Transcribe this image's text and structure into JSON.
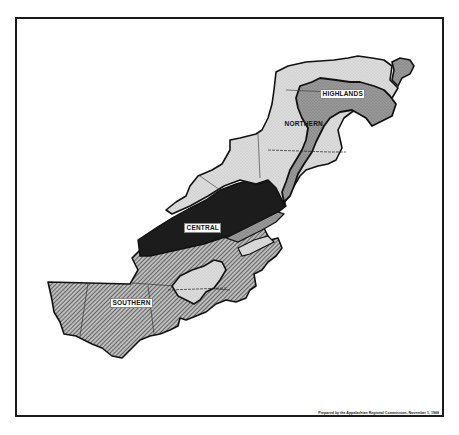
{
  "map": {
    "title": "",
    "regions": [
      {
        "id": "highlands",
        "label": "HIGHLANDS",
        "fill": "#8c8c8c",
        "pattern": "stipple-dark"
      },
      {
        "id": "northern",
        "label": "NORTHERN",
        "fill": "#d6d6d6",
        "pattern": "stipple-light"
      },
      {
        "id": "central",
        "label": "CENTRAL",
        "fill": "#1c1c1c",
        "pattern": "solid-black"
      },
      {
        "id": "southern",
        "label": "SOUTHERN",
        "fill": "#9a9a9a",
        "pattern": "diagonal-hatch"
      }
    ],
    "credit": "Prepared by the Appalachian Regional Commission, November 1, 1968"
  },
  "colors": {
    "frame": "#1a1a1a",
    "border": "#111111",
    "background": "#ffffff"
  }
}
